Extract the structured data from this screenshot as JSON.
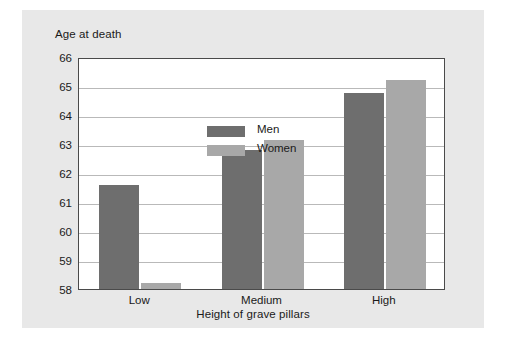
{
  "chart_data": {
    "type": "bar",
    "title": "Age at death",
    "xlabel": "Height of grave pillars",
    "ylabel": "Age at death",
    "categories": [
      "Low",
      "Medium",
      "High"
    ],
    "series": [
      {
        "name": "Men",
        "color": "#6e6e6e",
        "values": [
          61.6,
          62.8,
          64.75
        ]
      },
      {
        "name": "Women",
        "color": "#a8a8a8",
        "values": [
          58.2,
          63.15,
          65.2
        ]
      }
    ],
    "ylim": [
      58,
      66
    ],
    "ytick_step": 1,
    "ytick_labels": [
      "66",
      "65",
      "64",
      "63",
      "62",
      "61",
      "60",
      "59",
      "58"
    ],
    "grid": true,
    "legend_position": "top-left-inside"
  },
  "legend": {
    "items": [
      {
        "label": "Men"
      },
      {
        "label": "Women"
      }
    ]
  },
  "colors": {
    "men": "#6e6e6e",
    "women": "#a8a8a8",
    "panel": "#e8e8e8",
    "plot_background": "#ffffff",
    "frame": "#4a4a4a",
    "gridline": "#b9b9b9",
    "text": "#1a1a1a"
  }
}
